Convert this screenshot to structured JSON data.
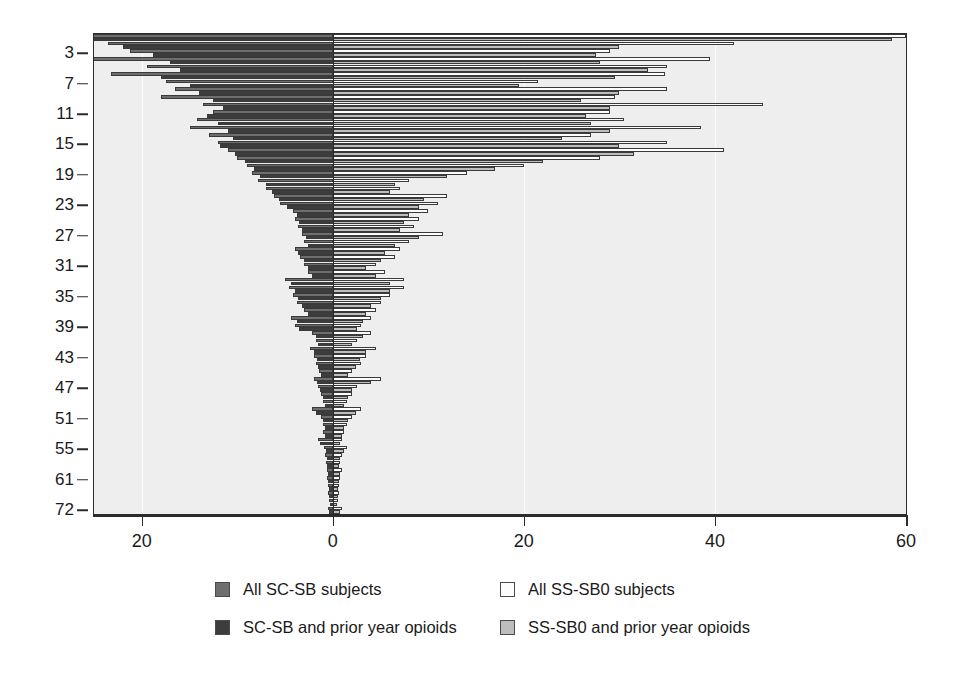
{
  "chart_data": {
    "type": "bar",
    "orientation": "horizontal-diverging",
    "title": "",
    "subtitle": "",
    "xlabel": "",
    "ylabel": "",
    "xlim": [
      -25,
      60
    ],
    "xticks": [
      -20,
      0,
      20,
      40,
      60
    ],
    "xticklabels": [
      "20",
      "0",
      "20",
      "40",
      "60"
    ],
    "grid": "vertical-light",
    "legend_position": "below",
    "yticklabels": [
      "3",
      "7",
      "11",
      "15",
      "19",
      "23",
      "27",
      "31",
      "35",
      "39",
      "43",
      "47",
      "51",
      "55",
      "61",
      "72"
    ],
    "ytick_rows": [
      2,
      6,
      10,
      14,
      18,
      22,
      26,
      30,
      34,
      38,
      42,
      46,
      50,
      54,
      58,
      62
    ],
    "categories": [
      "1",
      "2",
      "3",
      "4",
      "5",
      "6",
      "7",
      "8",
      "9",
      "10",
      "11",
      "12",
      "13",
      "14",
      "15",
      "16",
      "17",
      "18",
      "19",
      "20",
      "21",
      "22",
      "23",
      "24",
      "25",
      "26",
      "27",
      "28",
      "29",
      "30",
      "31",
      "32",
      "33",
      "34",
      "35",
      "36",
      "37",
      "38",
      "39",
      "40",
      "41",
      "42",
      "43",
      "44",
      "45",
      "46",
      "47",
      "48",
      "49",
      "50",
      "51",
      "52",
      "53",
      "54",
      "55",
      "56",
      "57",
      "58",
      "59",
      "60",
      "61",
      "62",
      "63"
    ],
    "series": [
      {
        "name": "All SC-SB subjects",
        "color": "#6e6e6e",
        "side": "left",
        "values": [
          30.5,
          23.5,
          21.2,
          28.5,
          19.5,
          23.2,
          17.5,
          16.5,
          18.0,
          13.6,
          12.5,
          14.2,
          15.0,
          13.0,
          12.0,
          11.0,
          10.0,
          9.0,
          8.5,
          7.8,
          7.0,
          6.2,
          5.5,
          4.2,
          4.0,
          3.6,
          3.2,
          3.0,
          4.0,
          3.4,
          3.0,
          2.6,
          5.0,
          4.6,
          4.2,
          3.8,
          3.0,
          4.4,
          4.0,
          2.2,
          1.8,
          2.4,
          2.0,
          1.8,
          1.4,
          2.0,
          1.6,
          1.2,
          1.0,
          2.2,
          1.2,
          1.0,
          1.0,
          1.6,
          0.9,
          0.8,
          0.7,
          0.6,
          0.6,
          0.5,
          0.5,
          0.4,
          0.5
        ]
      },
      {
        "name": "SC-SB and prior year opioids",
        "color": "#3d3d3d",
        "side": "left",
        "values": [
          30.5,
          22.0,
          18.8,
          17.0,
          16.0,
          18.0,
          15.0,
          14.0,
          12.5,
          11.5,
          13.2,
          12.0,
          11.0,
          10.5,
          11.8,
          10.2,
          9.2,
          8.2,
          7.6,
          7.0,
          6.4,
          5.6,
          4.8,
          3.8,
          3.5,
          3.2,
          2.8,
          2.6,
          3.6,
          3.0,
          2.6,
          2.2,
          4.4,
          4.0,
          3.6,
          3.2,
          2.6,
          3.8,
          3.5,
          1.8,
          1.5,
          2.0,
          1.7,
          1.5,
          1.2,
          1.7,
          1.3,
          1.0,
          0.8,
          1.8,
          1.0,
          0.8,
          0.8,
          1.3,
          0.7,
          0.6,
          0.6,
          0.5,
          0.5,
          0.4,
          0.4,
          0.3,
          0.4
        ]
      },
      {
        "name": "All SS-SB0 subjects",
        "color": "#fdfdfd",
        "side": "right",
        "values": [
          60.0,
          42.0,
          29.0,
          39.5,
          35.0,
          34.8,
          21.5,
          35.0,
          29.5,
          45.0,
          29.0,
          30.5,
          38.5,
          27.0,
          35.0,
          41.0,
          28.0,
          20.0,
          14.0,
          8.0,
          7.0,
          12.0,
          11.0,
          10.0,
          9.0,
          8.5,
          11.5,
          8.0,
          7.0,
          6.5,
          4.5,
          5.5,
          7.5,
          7.5,
          6.0,
          5.0,
          4.5,
          4.0,
          3.0,
          4.0,
          2.5,
          4.5,
          3.5,
          3.0,
          2.0,
          5.0,
          2.5,
          2.0,
          1.5,
          3.0,
          2.0,
          1.5,
          1.2,
          1.0,
          1.5,
          1.0,
          0.8,
          1.0,
          0.8,
          0.6,
          0.6,
          0.5,
          1.0
        ]
      },
      {
        "name": "SS-SB0 and prior year opioids",
        "color": "#bdbdbd",
        "side": "right",
        "values": [
          58.5,
          30.0,
          27.5,
          28.0,
          33.0,
          29.5,
          19.5,
          30.0,
          26.0,
          29.0,
          26.5,
          27.0,
          29.0,
          24.0,
          30.0,
          31.5,
          22.0,
          17.0,
          12.0,
          6.5,
          6.0,
          9.5,
          9.0,
          8.0,
          7.5,
          7.0,
          9.0,
          6.5,
          5.5,
          5.0,
          3.5,
          4.5,
          6.0,
          6.0,
          5.0,
          4.0,
          3.5,
          3.2,
          2.5,
          3.2,
          2.0,
          3.5,
          2.8,
          2.4,
          1.6,
          4.0,
          2.0,
          1.6,
          1.2,
          2.4,
          1.6,
          1.2,
          1.0,
          0.8,
          1.2,
          0.8,
          0.6,
          0.8,
          0.6,
          0.5,
          0.5,
          0.4,
          0.8
        ]
      }
    ],
    "legend": [
      {
        "label": "All SC-SB subjects",
        "swatch": "#6e6e6e"
      },
      {
        "label": "All SS-SB0 subjects",
        "swatch": "#fdfdfd"
      },
      {
        "label": "SC-SB and prior year opioids",
        "swatch": "#3d3d3d"
      },
      {
        "label": "SS-SB0 and prior year opioids",
        "swatch": "#bdbdbd"
      }
    ]
  }
}
